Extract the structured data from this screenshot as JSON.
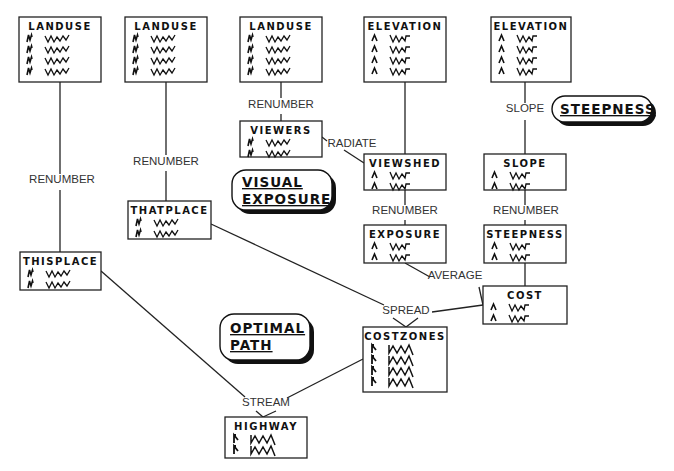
{
  "diagram": {
    "type": "flowchart",
    "nodes": [
      {
        "id": "landuse1",
        "title": "LANDUSE",
        "rows": 4,
        "glyph": "nominal"
      },
      {
        "id": "landuse2",
        "title": "LANDUSE",
        "rows": 4,
        "glyph": "nominal"
      },
      {
        "id": "landuse3",
        "title": "LANDUSE",
        "rows": 4,
        "glyph": "nominal"
      },
      {
        "id": "elevation1",
        "title": "ELEVATION",
        "rows": 4,
        "glyph": "continuous"
      },
      {
        "id": "elevation2",
        "title": "ELEVATION",
        "rows": 4,
        "glyph": "continuous"
      },
      {
        "id": "viewers",
        "title": "VIEWERS",
        "rows": 2,
        "glyph": "nominal"
      },
      {
        "id": "viewshed",
        "title": "VIEWSHED",
        "rows": 2,
        "glyph": "continuous"
      },
      {
        "id": "slope",
        "title": "SLOPE",
        "rows": 2,
        "glyph": "continuous"
      },
      {
        "id": "thatplace",
        "title": "THATPLACE",
        "rows": 2,
        "glyph": "nominal"
      },
      {
        "id": "exposure",
        "title": "EXPOSURE",
        "rows": 2,
        "glyph": "continuous"
      },
      {
        "id": "steepness",
        "title": "STEEPNESS",
        "rows": 2,
        "glyph": "continuous"
      },
      {
        "id": "thisplace",
        "title": "THISPLACE",
        "rows": 2,
        "glyph": "nominal"
      },
      {
        "id": "cost",
        "title": "COST",
        "rows": 2,
        "glyph": "continuous"
      },
      {
        "id": "costzones",
        "title": "COSTZONES",
        "rows": 4,
        "glyph": "zones"
      },
      {
        "id": "highway",
        "title": "HIGHWAY",
        "rows": 2,
        "glyph": "zones"
      }
    ],
    "operations": [
      {
        "id": "op-renumber-1",
        "label": "RENUMBER",
        "from": [
          "landuse1"
        ],
        "to": "thisplace"
      },
      {
        "id": "op-renumber-2",
        "label": "RENUMBER",
        "from": [
          "landuse2"
        ],
        "to": "thatplace"
      },
      {
        "id": "op-renumber-3",
        "label": "RENUMBER",
        "from": [
          "landuse3"
        ],
        "to": "viewers"
      },
      {
        "id": "op-radiate",
        "label": "RADIATE",
        "from": [
          "viewers",
          "elevation1"
        ],
        "to": "viewshed"
      },
      {
        "id": "op-slope",
        "label": "SLOPE",
        "from": [
          "elevation2"
        ],
        "to": "slope"
      },
      {
        "id": "op-renumber-4",
        "label": "RENUMBER",
        "from": [
          "viewshed"
        ],
        "to": "exposure"
      },
      {
        "id": "op-renumber-5",
        "label": "RENUMBER",
        "from": [
          "slope"
        ],
        "to": "steepness"
      },
      {
        "id": "op-average",
        "label": "AVERAGE",
        "from": [
          "exposure",
          "steepness"
        ],
        "to": "cost"
      },
      {
        "id": "op-spread",
        "label": "SPREAD",
        "from": [
          "thatplace",
          "cost"
        ],
        "to": "costzones"
      },
      {
        "id": "op-stream",
        "label": "STREAM",
        "from": [
          "thisplace",
          "costzones"
        ],
        "to": "highway"
      }
    ],
    "themes": [
      {
        "id": "visual-exposure",
        "lines": [
          "VISUAL",
          "EXPOSURE"
        ]
      },
      {
        "id": "steepness-theme",
        "lines": [
          "STEEPNESS"
        ]
      },
      {
        "id": "optimal-path",
        "lines": [
          "OPTIMAL",
          "PATH"
        ]
      }
    ]
  }
}
